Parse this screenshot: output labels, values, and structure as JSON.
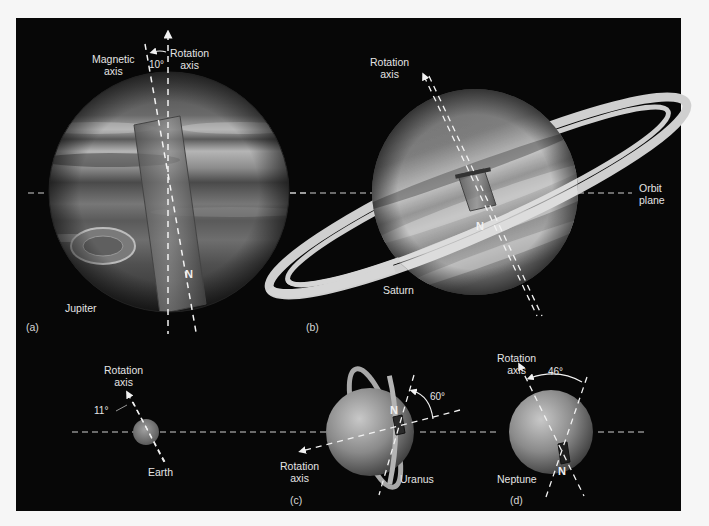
{
  "figure": {
    "panels": [
      {
        "id": "a",
        "label": "(a)",
        "planet": "Jupiter",
        "labels": {
          "magnetic_axis_line1": "Magnetic",
          "magnetic_axis_line2": "axis",
          "rotation_axis_line1": "Rotation",
          "rotation_axis_line2": "axis",
          "angle": "10°",
          "north": "N"
        },
        "tilt_degrees": 10
      },
      {
        "id": "b",
        "label": "(b)",
        "planet": "Saturn",
        "labels": {
          "rotation_axis_top_line1": "Rotation",
          "rotation_axis_top_line2": "axis",
          "rotation_axis_bottom_line1": "Rotation",
          "rotation_axis_bottom_line2": "axis",
          "orbit_plane_line1": "Orbit",
          "orbit_plane_line2": "plane",
          "north": "N"
        }
      },
      {
        "id": "c",
        "label": "(c)",
        "planets": [
          {
            "name": "Earth",
            "labels": {
              "rotation_axis_line1": "Rotation",
              "rotation_axis_line2": "axis",
              "angle": "11°"
            },
            "tilt_degrees": 11
          },
          {
            "name": "Uranus",
            "labels": {
              "rotation_axis_line1": "Rotation",
              "rotation_axis_line2": "axis",
              "angle": "60°",
              "north": "N"
            },
            "tilt_degrees": 60
          }
        ]
      },
      {
        "id": "d",
        "label": "(d)",
        "planet": "Neptune",
        "labels": {
          "rotation_axis_line1": "Rotation",
          "rotation_axis_line2": "axis",
          "angle": "46°",
          "north": "N"
        },
        "tilt_degrees": 46
      }
    ],
    "colors": {
      "background": "#070707",
      "page": "#f6f6f6",
      "label_text": "#e4e4e4",
      "axis_dash": "#f2f2f2",
      "ring": "#cfcfcf"
    }
  }
}
